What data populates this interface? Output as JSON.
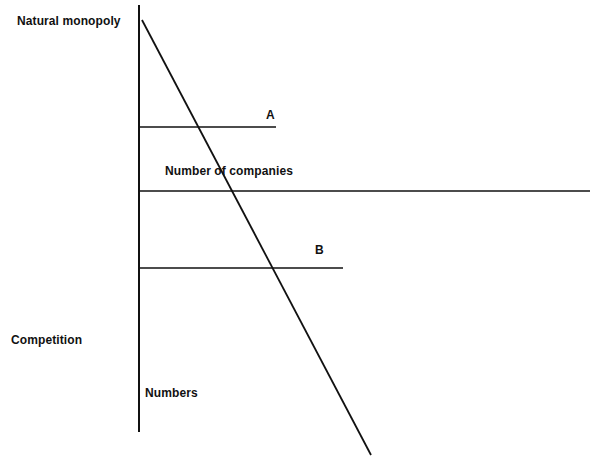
{
  "labels": {
    "natural_monopoly": "Natural monopoly",
    "number_of_companies": "Number of companies",
    "competition": "Competition",
    "numbers": "Numbers",
    "line_a": "A",
    "line_b": "B"
  },
  "colors": {
    "line": "#111111",
    "background": "#ffffff"
  }
}
